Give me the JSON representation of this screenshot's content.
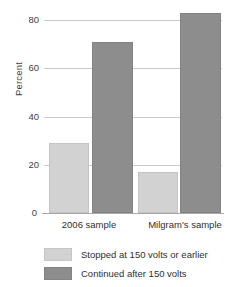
{
  "chart_data": {
    "type": "bar",
    "title": "",
    "subtitle": "",
    "xlabel": "",
    "ylabel": "Percent",
    "categories": [
      "2006 sample",
      "Milgram's sample"
    ],
    "series": [
      {
        "name": "Stopped at 150 volts or earlier",
        "color": "#d2d2d2",
        "values": [
          28,
          16
        ]
      },
      {
        "name": "Continued after 150 volts",
        "color": "#8d8d8d",
        "values": [
          70,
          82
        ]
      }
    ],
    "ylim": [
      0,
      80
    ],
    "yticks": [
      0,
      20,
      40,
      60,
      80
    ],
    "ytick_labels": [
      "0",
      "20",
      "40",
      "60",
      "80"
    ],
    "grid": true,
    "legend_position": "bottom"
  },
  "axes": {
    "y_title": "Percent",
    "tick_labels": [
      "80",
      "60",
      "40",
      "20",
      "0"
    ],
    "tick_values": [
      80,
      60,
      40,
      20,
      0
    ]
  },
  "categories": [
    {
      "label": "2006 sample"
    },
    {
      "label": "Milgram's sample"
    }
  ],
  "legend": {
    "items": [
      {
        "label": "Stopped at 150 volts or earlier",
        "swatch": "light-gray-swatch"
      },
      {
        "label": "Continued after 150 volts",
        "swatch": "dark-gray-swatch"
      }
    ]
  },
  "colors": {
    "light_bar": "#d2d2d2",
    "dark_bar": "#8d8d8d",
    "gridline": "#c9c9c9",
    "axis": "#a8a8a8",
    "text": "#2f2f2f",
    "background": "#ffffff"
  }
}
